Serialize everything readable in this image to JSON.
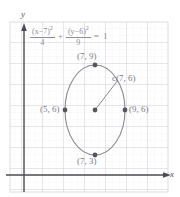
{
  "figure": {
    "kind": "coordinate-plane-ellipse-diagram",
    "background_color": "#ffffff",
    "grid": {
      "minor_color": "#e2e2e6",
      "major_color": "#c9c9cf",
      "minor_step_px": 7,
      "major_step_px": 21,
      "left_px": 10,
      "top_px": 22,
      "right_px": 168,
      "bottom_px": 192,
      "show_grid": true
    },
    "axes": {
      "x_axis_label": "x",
      "y_axis_label": "y",
      "axis_color": "#4a4a50",
      "x_axis_y_px": 175,
      "y_axis_x_px": 24,
      "x_arrow": true,
      "y_arrow": true
    },
    "equation": {
      "x_numerator_base": "(x",
      "x_numerator_minus": "−",
      "x_numerator_value": "7)",
      "x_numerator_power": "2",
      "x_denominator": "4",
      "plus": "+",
      "y_numerator_base": "(y",
      "y_numerator_minus": "−",
      "y_numerator_value": "6)",
      "y_numerator_power": "2",
      "y_denominator": "9",
      "equals": "=",
      "right_side": "1",
      "color": "#8d8d92"
    },
    "ellipse": {
      "center_x_units": 7,
      "center_y_units": 6,
      "semi_axis_x_units": 2,
      "semi_axis_y_units": 3,
      "stroke_color": "#88888f",
      "center_px": {
        "x": 95,
        "y": 110
      },
      "radius_px": {
        "x": 30,
        "y": 45
      }
    },
    "points": [
      {
        "id": "top-vertex",
        "label": "(7, 9)",
        "px": {
          "x": 95,
          "y": 65
        },
        "label_px": {
          "x": 77,
          "y": 51
        }
      },
      {
        "id": "center",
        "label": "c(7, 6)",
        "px": {
          "x": 95,
          "y": 110
        },
        "label_px": {
          "x": 112,
          "y": 73
        }
      },
      {
        "id": "left-vertex",
        "label": "(5, 6)",
        "px": {
          "x": 65,
          "y": 110
        },
        "label_px": {
          "x": 40,
          "y": 104
        }
      },
      {
        "id": "right-vertex",
        "label": "(9, 6)",
        "px": {
          "x": 125,
          "y": 110
        },
        "label_px": {
          "x": 129,
          "y": 104
        }
      },
      {
        "id": "bottom-vertex",
        "label": "(7, 3)",
        "px": {
          "x": 95,
          "y": 155
        },
        "label_px": {
          "x": 77,
          "y": 156
        }
      }
    ],
    "radius_segment": {
      "from_px": {
        "x": 95,
        "y": 110
      },
      "to_px": {
        "x": 118,
        "y": 80
      },
      "color": "#88888f"
    },
    "point_marker_color": "#55555a"
  }
}
